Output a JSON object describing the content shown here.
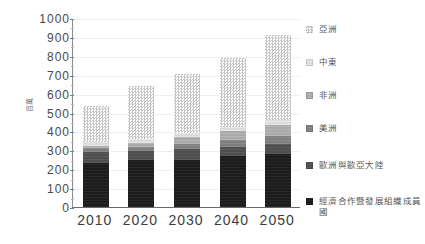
{
  "chart_data": {
    "type": "bar",
    "subtype": "stacked-bar",
    "title": "",
    "xlabel": "",
    "ylabel": "百萬",
    "categories": [
      "2010",
      "2020",
      "2030",
      "2040",
      "2050"
    ],
    "ylim": [
      0,
      1000
    ],
    "ytick_step": 100,
    "yticks": [
      "1000",
      "900",
      "800",
      "700",
      "600",
      "500",
      "400",
      "300",
      "200",
      "100",
      "0"
    ],
    "grid": true,
    "legend_position": "right",
    "stack_order_bottom_to_top": [
      "oecd",
      "europe",
      "americas",
      "africa",
      "mideast",
      "asia"
    ],
    "series": [
      {
        "key": "asia",
        "name": "亞洲",
        "color": "#c6c6c6",
        "pattern": "checkered",
        "values": [
          190,
          280,
          315,
          365,
          450
        ]
      },
      {
        "key": "mideast",
        "name": "中東",
        "color": "#dcdcdc",
        "pattern": "light-solid",
        "values": [
          20,
          20,
          20,
          25,
          25
        ]
      },
      {
        "key": "africa",
        "name": "非洲",
        "color": "#a9a9a9",
        "pattern": "mid-gray",
        "values": [
          15,
          20,
          35,
          45,
          60
        ]
      },
      {
        "key": "americas",
        "name": "美洲",
        "color": "#7e7e7e",
        "pattern": "dark-gray",
        "values": [
          20,
          22,
          30,
          35,
          40
        ]
      },
      {
        "key": "europe",
        "name": "歐洲與歐亞大陸",
        "color": "#4e4e4e",
        "pattern": "darker-gray",
        "values": [
          55,
          50,
          55,
          52,
          53
        ]
      },
      {
        "key": "oecd",
        "name": "經濟合作暨發展組織成員國",
        "color": "#1c1c1c",
        "pattern": "near-black",
        "values": [
          235,
          248,
          250,
          268,
          282
        ]
      }
    ],
    "totals": [
      535,
      640,
      705,
      790,
      910
    ]
  },
  "legend": {
    "items": [
      {
        "label": "亞洲",
        "swatch_class": "fill-asia",
        "name": "legend-item-asia"
      },
      {
        "label": "中東",
        "swatch_class": "fill-mideast",
        "name": "legend-item-middle-east"
      },
      {
        "label": "非洲",
        "swatch_class": "fill-africa",
        "name": "legend-item-africa"
      },
      {
        "label": "美洲",
        "swatch_class": "fill-americas",
        "name": "legend-item-americas"
      },
      {
        "label": "歐洲與歐亞大陸",
        "swatch_class": "fill-europe",
        "name": "legend-item-europe-eurasia"
      },
      {
        "label": "經濟合作暨發展組織成員國",
        "swatch_class": "fill-oecd",
        "name": "legend-item-oecd"
      }
    ]
  }
}
